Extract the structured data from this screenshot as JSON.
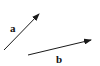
{
  "diagram": {
    "vectors": [
      {
        "name": "a",
        "label": "a",
        "x1": 4,
        "y1": 50,
        "x2": 39,
        "y2": 14
      },
      {
        "name": "b",
        "label": "b",
        "x1": 28,
        "y1": 55,
        "x2": 91,
        "y2": 40
      }
    ],
    "colors": {
      "stroke": "#1a1a1a",
      "background": "#ffffff"
    }
  }
}
